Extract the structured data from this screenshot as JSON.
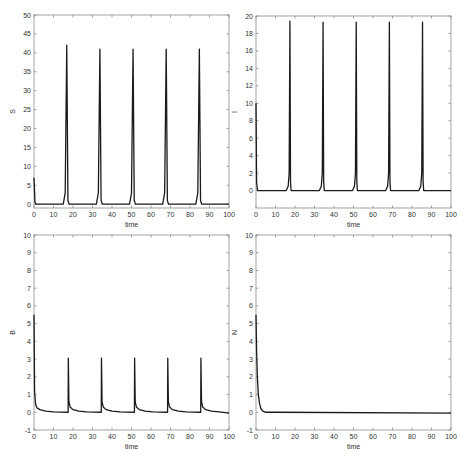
{
  "figure": {
    "width": 471,
    "height": 461,
    "line_color": "#1a1a1a",
    "axis_color": "#8c8c8c",
    "tick_label_color": "#444444"
  },
  "chart_data": [
    {
      "type": "line",
      "title": "",
      "xlabel": "time",
      "ylabel": "S",
      "xlim": [
        0,
        100
      ],
      "ylim": [
        -1,
        50
      ],
      "xticks": [
        0,
        10,
        20,
        30,
        40,
        50,
        60,
        70,
        80,
        90,
        100
      ],
      "yticks": [
        0,
        5,
        10,
        15,
        20,
        25,
        30,
        35,
        40,
        45,
        50
      ],
      "grid": false,
      "box": {
        "left": 34,
        "top": 15,
        "right": 229,
        "bottom": 208
      },
      "initial_value": 7,
      "baseline": 0,
      "peaks": [
        {
          "t": 16.8,
          "value": 42
        },
        {
          "t": 33.8,
          "value": 41
        },
        {
          "t": 50.8,
          "value": 41
        },
        {
          "t": 67.8,
          "value": 41
        },
        {
          "t": 84.8,
          "value": 41
        }
      ],
      "peak_shape": "sharp-rise",
      "series": [
        {
          "name": "S",
          "x": [
            0,
            0.5,
            1,
            15,
            16,
            16.8,
            17.4,
            18,
            32,
            33,
            33.8,
            34.4,
            35,
            49,
            50,
            50.8,
            51.4,
            52,
            66,
            67,
            67.8,
            68.4,
            69,
            83,
            84,
            84.8,
            85.4,
            86,
            100
          ],
          "values": [
            7,
            0.5,
            0,
            0,
            3,
            42,
            1,
            0,
            0,
            3,
            41,
            1,
            0,
            0,
            3,
            41,
            1,
            0,
            0,
            3,
            41,
            1,
            0,
            0,
            3,
            41,
            1,
            0,
            0
          ]
        }
      ]
    },
    {
      "type": "line",
      "title": "",
      "xlabel": "time",
      "ylabel": "I",
      "xlim": [
        0,
        100
      ],
      "ylim": [
        -2,
        20
      ],
      "xticks": [
        0,
        10,
        20,
        30,
        40,
        50,
        60,
        70,
        80,
        90,
        100
      ],
      "yticks": [
        0,
        2,
        4,
        6,
        8,
        10,
        12,
        14,
        16,
        18,
        20
      ],
      "grid": false,
      "box": {
        "left": 256,
        "top": 16,
        "right": 451,
        "bottom": 208
      },
      "initial_value": 10,
      "baseline": 0,
      "peaks": [
        {
          "t": 17.4,
          "value": 19.4
        },
        {
          "t": 34.4,
          "value": 19.3
        },
        {
          "t": 51.4,
          "value": 19.3
        },
        {
          "t": 68.4,
          "value": 19.3
        },
        {
          "t": 85.4,
          "value": 19.3
        }
      ],
      "series": [
        {
          "name": "I",
          "x": [
            0,
            0.3,
            0.8,
            15.5,
            16.5,
            17.0,
            17.4,
            17.7,
            18,
            32.5,
            33.5,
            34.0,
            34.4,
            34.7,
            35,
            49.5,
            50.5,
            51.0,
            51.4,
            51.7,
            52,
            66.5,
            67.5,
            68.0,
            68.4,
            68.7,
            69,
            83.5,
            84.5,
            85.0,
            85.4,
            85.7,
            86,
            100
          ],
          "values": [
            10,
            1,
            0,
            0,
            0.5,
            2,
            19.4,
            1,
            0,
            0,
            0.5,
            2,
            19.3,
            1,
            0,
            0,
            0.5,
            2,
            19.3,
            1,
            0,
            0,
            0.5,
            2,
            19.3,
            1,
            0,
            0,
            0.5,
            2,
            19.3,
            1,
            0,
            0
          ]
        }
      ]
    },
    {
      "type": "line",
      "title": "",
      "xlabel": "time",
      "ylabel": "B",
      "xlim": [
        0,
        100
      ],
      "ylim": [
        -1,
        10
      ],
      "xticks": [
        0,
        10,
        20,
        30,
        40,
        50,
        60,
        70,
        80,
        90,
        100
      ],
      "yticks": [
        -1,
        0,
        1,
        2,
        3,
        4,
        5,
        6,
        7,
        8,
        9,
        10
      ],
      "grid": false,
      "box": {
        "left": 34,
        "top": 235,
        "right": 229,
        "bottom": 430
      },
      "initial_value": 5.5,
      "baseline": 0,
      "peaks": [
        {
          "t": 17.6,
          "value": 3.05
        },
        {
          "t": 34.6,
          "value": 3.05
        },
        {
          "t": 51.6,
          "value": 3.05
        },
        {
          "t": 68.6,
          "value": 3.05
        },
        {
          "t": 85.6,
          "value": 3.05
        }
      ],
      "series": [
        {
          "name": "B",
          "x": [
            0,
            0.3,
            0.8,
            1.5,
            3,
            6,
            10,
            17.5,
            17.6,
            17.9,
            18.5,
            20,
            23,
            27,
            34.5,
            34.6,
            34.9,
            35.5,
            37,
            40,
            44,
            51.5,
            51.6,
            51.9,
            52.5,
            54,
            57,
            61,
            68.5,
            68.6,
            68.9,
            69.5,
            71,
            74,
            78,
            85.5,
            85.6,
            85.9,
            86.5,
            88,
            91,
            95,
            100
          ],
          "values": [
            5.5,
            1.2,
            0.45,
            0.25,
            0.15,
            0.06,
            0.02,
            0,
            3.05,
            0.6,
            0.3,
            0.15,
            0.06,
            0.02,
            0,
            3.05,
            0.6,
            0.3,
            0.15,
            0.06,
            0.02,
            0,
            3.05,
            0.6,
            0.3,
            0.15,
            0.06,
            0.02,
            0,
            3.05,
            0.6,
            0.3,
            0.15,
            0.06,
            0.02,
            0,
            3.05,
            0.6,
            0.3,
            0.15,
            0.06,
            0.02,
            -0.05
          ]
        }
      ]
    },
    {
      "type": "line",
      "title": "",
      "xlabel": "time",
      "ylabel": "N",
      "xlim": [
        0,
        100
      ],
      "ylim": [
        -1,
        10
      ],
      "xticks": [
        0,
        10,
        20,
        30,
        40,
        50,
        60,
        70,
        80,
        90,
        100
      ],
      "yticks": [
        -1,
        0,
        1,
        2,
        3,
        4,
        5,
        6,
        7,
        8,
        9,
        10
      ],
      "grid": false,
      "box": {
        "left": 256,
        "top": 235,
        "right": 451,
        "bottom": 430
      },
      "initial_value": 5.5,
      "baseline": 0,
      "series": [
        {
          "name": "N",
          "x": [
            0,
            0.3,
            0.7,
            1.2,
            1.8,
            2.5,
            3.5,
            5,
            10,
            100
          ],
          "values": [
            5.5,
            3.5,
            2.0,
            1.0,
            0.5,
            0.2,
            0.06,
            0,
            0,
            -0.05
          ]
        }
      ]
    }
  ]
}
